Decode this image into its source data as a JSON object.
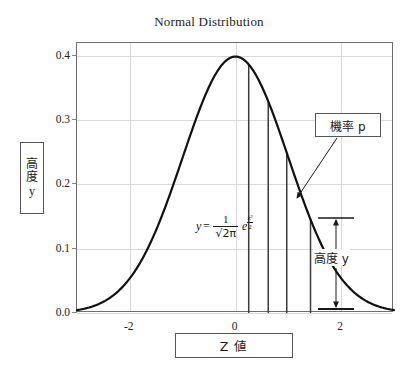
{
  "chart_data": {
    "type": "line",
    "title": "Normal Distribution",
    "xlabel": "Z 値",
    "ylabel": "高度 y",
    "xlim": [
      -3.0,
      3.0
    ],
    "ylim": [
      0.0,
      0.42
    ],
    "grid": true,
    "legend": null,
    "x_ticks": [
      -2,
      0,
      2
    ],
    "x_tick_labels": [
      "-2",
      "0",
      "2"
    ],
    "y_ticks": [
      0.0,
      0.1,
      0.2,
      0.3,
      0.4
    ],
    "y_tick_labels": [
      "0.0",
      "0.1",
      "0.2",
      "0.3",
      "0.4"
    ],
    "series": [
      {
        "name": "standard normal pdf",
        "x": [
          -3.0,
          -2.8,
          -2.6,
          -2.4,
          -2.2,
          -2.0,
          -1.8,
          -1.6,
          -1.4,
          -1.2,
          -1.0,
          -0.8,
          -0.6,
          -0.4,
          -0.2,
          0.0,
          0.2,
          0.4,
          0.6,
          0.8,
          1.0,
          1.2,
          1.4,
          1.6,
          1.8,
          2.0,
          2.2,
          2.4,
          2.6,
          2.8,
          3.0
        ],
        "y": [
          0.004,
          0.008,
          0.014,
          0.022,
          0.035,
          0.054,
          0.079,
          0.111,
          0.15,
          0.194,
          0.242,
          0.29,
          0.333,
          0.368,
          0.391,
          0.399,
          0.391,
          0.368,
          0.333,
          0.29,
          0.242,
          0.194,
          0.15,
          0.111,
          0.079,
          0.054,
          0.035,
          0.022,
          0.014,
          0.008,
          0.004
        ]
      }
    ],
    "drop_lines": [
      {
        "z": 0.25,
        "y": 0.387
      },
      {
        "z": 0.62,
        "y": 0.328
      },
      {
        "z": 0.97,
        "y": 0.249
      },
      {
        "z": 1.42,
        "y": 0.147
      }
    ],
    "annotations": [
      {
        "name": "probability-callout",
        "text": "機率 p",
        "points_to_z": 1.42,
        "points_to_y": 0.147
      },
      {
        "name": "height-measure",
        "text": "高度 y",
        "at_z": 2.05,
        "from_y": 0.0,
        "to_y": 0.147
      },
      {
        "name": "pdf-formula",
        "text": "y = 1/√(2π) e^(z²/2)",
        "at_z": -0.1,
        "at_y": 0.105
      }
    ]
  },
  "title": {
    "text": "Normal Distribution"
  },
  "y_axis": {
    "label_cjk": "高度",
    "label_cjk_char1": "高",
    "label_cjk_char2": "度",
    "label_latin": "y",
    "ticks": [
      "0.4",
      "0.3",
      "0.2",
      "0.1",
      "0.0"
    ]
  },
  "x_axis": {
    "label": "Z 値",
    "ticks": [
      "-2",
      "0",
      "2"
    ]
  },
  "callouts": {
    "probability": "機率 p",
    "height": "高度 y"
  },
  "formula": {
    "lhs": "y",
    "equals": "=",
    "numerator": "1",
    "denominator": "√2π",
    "exp_base": "e",
    "exp_num": "z²",
    "exp_den": "2",
    "plain": "y = 1/√2π e^(z²/2)"
  },
  "icons": {
    "arrow": "arrow-icon"
  }
}
